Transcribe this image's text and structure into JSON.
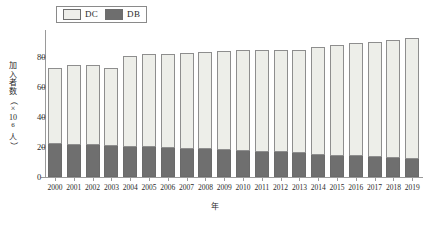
{
  "legend": {
    "items": [
      {
        "label": "DC",
        "color": "#edeee9",
        "icon": "legend-swatch-icon"
      },
      {
        "label": "DB",
        "color": "#6f6f6f",
        "icon": "legend-swatch-icon"
      }
    ]
  },
  "axes": {
    "y_ticks": [
      "80",
      "60",
      "40",
      "20",
      "0"
    ],
    "y_title_chars": [
      "加",
      "入",
      "者",
      "数",
      "（",
      "×",
      "10",
      "6",
      "人",
      "）"
    ],
    "y_title": "加入者数（×10⁶人）",
    "x_title": "年"
  },
  "chart_data": {
    "type": "bar",
    "title": "",
    "subtitle": "",
    "xlabel": "年",
    "ylabel": "加入者数（×10⁶人）",
    "ylim": [
      0,
      90
    ],
    "yticks": [
      0,
      20,
      40,
      60,
      80
    ],
    "grid": false,
    "stacked": true,
    "legend_position": "top-left",
    "categories": [
      "2000",
      "2001",
      "2002",
      "2003",
      "2004",
      "2005",
      "2006",
      "2007",
      "2008",
      "2009",
      "2010",
      "2011",
      "2012",
      "2013",
      "2014",
      "2015",
      "2016",
      "2017",
      "2018",
      "2019"
    ],
    "series": [
      {
        "name": "DB",
        "color": "#6f6f6f",
        "values": [
          22.0,
          21.5,
          21.3,
          20.7,
          20.0,
          19.7,
          19.3,
          19.0,
          18.5,
          17.8,
          17.3,
          17.0,
          16.5,
          16.2,
          14.6,
          14.1,
          13.8,
          13.3,
          12.8,
          12.2
        ]
      },
      {
        "name": "DC",
        "color": "#edeee9",
        "values": [
          51.0,
          53.0,
          53.2,
          52.0,
          60.7,
          62.0,
          62.8,
          64.0,
          64.8,
          66.5,
          67.7,
          67.5,
          68.0,
          68.8,
          72.3,
          74.2,
          75.7,
          76.7,
          78.4,
          80.8
        ]
      }
    ],
    "totals": [
      73.0,
      74.5,
      74.5,
      72.7,
      80.7,
      81.7,
      82.1,
      83.0,
      83.3,
      84.3,
      85.0,
      84.5,
      84.5,
      85.0,
      86.9,
      88.3,
      89.5,
      90.0,
      91.2,
      93.0
    ]
  }
}
